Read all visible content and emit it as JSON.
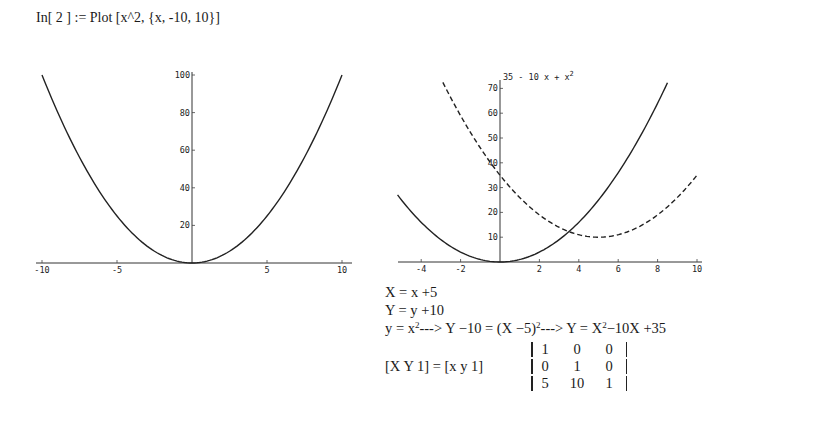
{
  "input_line": {
    "prompt": "In[ 2 ] := ",
    "command": "Plot [x^2, {x, -10, 10}]"
  },
  "chart_data": [
    {
      "type": "line",
      "title": "",
      "series": [
        {
          "name": "x^2",
          "style": "solid",
          "x": [
            -10,
            -8,
            -6,
            -4,
            -2,
            0,
            2,
            4,
            6,
            8,
            10
          ],
          "values": [
            100,
            64,
            36,
            16,
            4,
            0,
            4,
            16,
            36,
            64,
            100
          ]
        }
      ],
      "xlabel": "",
      "ylabel": "",
      "xlim": [
        -10,
        10
      ],
      "ylim": [
        0,
        100
      ],
      "x_ticks": [
        "-10",
        "-5",
        "5",
        "10"
      ],
      "y_ticks": [
        "20",
        "40",
        "60",
        "80",
        "100"
      ],
      "grid": false,
      "legend": null
    },
    {
      "type": "line",
      "title": "",
      "series": [
        {
          "name": "x^2",
          "style": "solid",
          "x": [
            -5.2,
            -4,
            -2,
            0,
            2,
            4,
            6,
            8,
            8.5
          ],
          "values": [
            27,
            16,
            4,
            0,
            4,
            16,
            36,
            64,
            72
          ]
        },
        {
          "name": "35 - 10 x + x^2",
          "style": "dashed",
          "x": [
            -3,
            -2,
            0,
            2,
            4,
            5,
            6,
            8,
            10
          ],
          "values": [
            74,
            59,
            35,
            19,
            11,
            10,
            11,
            19,
            35
          ]
        }
      ],
      "annotation": "35 - 10 x + x²",
      "xlabel": "",
      "ylabel": "",
      "xlim": [
        -5.2,
        10
      ],
      "ylim": [
        0,
        73
      ],
      "x_ticks": [
        "-4",
        "-2",
        "2",
        "4",
        "6",
        "8",
        "10"
      ],
      "y_ticks": [
        "10",
        "20",
        "30",
        "40",
        "50",
        "60",
        "70"
      ],
      "grid": false,
      "legend": null
    }
  ],
  "plots": {
    "left": {
      "x_ticks": [
        {
          "label": "-10",
          "value": -10
        },
        {
          "label": "-5",
          "value": -5
        },
        {
          "label": "5",
          "value": 5
        },
        {
          "label": "10",
          "value": 10
        }
      ],
      "y_ticks": [
        {
          "label": "20",
          "value": 20
        },
        {
          "label": "40",
          "value": 40
        },
        {
          "label": "60",
          "value": 60
        },
        {
          "label": "80",
          "value": 80
        },
        {
          "label": "100",
          "value": 100
        }
      ]
    },
    "right": {
      "curve_label": "35 - 10 x + x",
      "curve_label_sup": "2",
      "x_ticks": [
        {
          "label": "-4",
          "value": -4
        },
        {
          "label": "-2",
          "value": -2
        },
        {
          "label": "2",
          "value": 2
        },
        {
          "label": "4",
          "value": 4
        },
        {
          "label": "6",
          "value": 6
        },
        {
          "label": "8",
          "value": 8
        },
        {
          "label": "10",
          "value": 10
        }
      ],
      "y_ticks": [
        {
          "label": "10",
          "value": 10
        },
        {
          "label": "20",
          "value": 20
        },
        {
          "label": "30",
          "value": 30
        },
        {
          "label": "40",
          "value": 40
        },
        {
          "label": "50",
          "value": 50
        },
        {
          "label": "60",
          "value": 60
        },
        {
          "label": "70",
          "value": 70
        }
      ]
    }
  },
  "equations": {
    "line1": "X = x +5",
    "line2": "Y = y +10",
    "line3": {
      "a": "y = x",
      "a_sup": "2",
      "b": "---> Y −10 = (X −5)",
      "b_sup": "2",
      "c": "---> Y = X",
      "c_sup": "2",
      "d": "−10X +35"
    },
    "line4_lhs": "[X Y 1] = [x y 1]"
  },
  "matrix": [
    [
      "1",
      "0",
      "0"
    ],
    [
      "0",
      "1",
      "0"
    ],
    [
      "5",
      "10",
      "1"
    ]
  ]
}
